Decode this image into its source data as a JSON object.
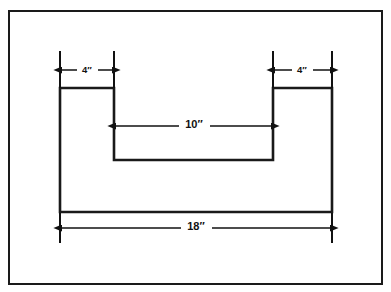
{
  "figure": {
    "border": {
      "name": "drawing-frame",
      "stroke_color": "#1a1a1a",
      "fill_color": "#ffffff",
      "x": 8,
      "y": 10,
      "width": 375,
      "height": 275,
      "stroke_width": 2
    },
    "shape": {
      "name": "u-channel-outline",
      "stroke_color": "#1a1a1a",
      "fill_color": "#ffffff",
      "stroke_width": 2.6,
      "outer_left": 60,
      "outer_right": 332,
      "top": 88,
      "bottom": 212,
      "notch_left": 114,
      "notch_right": 273,
      "notch_bottom": 160,
      "path": "M 60 88 L 114 88 L 114 160 L 273 160 L 273 88 L 332 88 L 332 212 L 60 212 Z"
    },
    "dimensions": [
      {
        "name": "dimension-left-flange-width",
        "label": "4″",
        "value": 4,
        "unit": "inches",
        "orientation": "horizontal",
        "line_y": 70,
        "from_x": 60,
        "to_x": 114,
        "label_x": 87,
        "witness_top": 51,
        "witness_bottom": 88,
        "arrows": "both"
      },
      {
        "name": "dimension-right-flange-width",
        "label": "4″",
        "value": 4,
        "unit": "inches",
        "orientation": "horizontal",
        "line_y": 70,
        "from_x": 273,
        "to_x": 332,
        "label_x": 302,
        "witness_top": 51,
        "witness_bottom": 88,
        "arrows": "both"
      },
      {
        "name": "dimension-notch-width",
        "label": "10″",
        "value": 10,
        "unit": "inches",
        "orientation": "horizontal",
        "line_y": 126,
        "from_x": 114,
        "to_x": 273,
        "label_x": 194,
        "arrows": "both"
      },
      {
        "name": "dimension-overall-width",
        "label": "18″",
        "value": 18,
        "unit": "inches",
        "orientation": "horizontal",
        "line_y": 228,
        "from_x": 60,
        "to_x": 332,
        "label_x": 196,
        "witness_top": 212,
        "witness_bottom": 243,
        "arrows": "both"
      }
    ]
  }
}
